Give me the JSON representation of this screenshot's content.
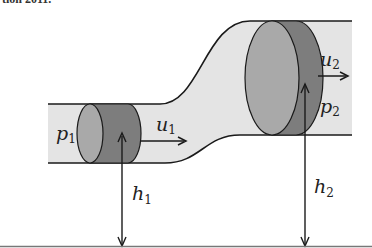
{
  "caption_fragment": "tion 2011.",
  "diagram": {
    "labels": {
      "p1": {
        "base": "p",
        "sub": "1"
      },
      "u1": {
        "base": "u",
        "sub": "1"
      },
      "h1": {
        "base": "h",
        "sub": "1"
      },
      "p2": {
        "base": "p",
        "sub": "2"
      },
      "u2": {
        "base": "u",
        "sub": "2"
      },
      "h2": {
        "base": "h",
        "sub": "2"
      }
    },
    "colors": {
      "pipe_fill": "#e4e4e4",
      "pipe_stroke": "#1a1a1a",
      "cylinder_face": "#a9a9a9",
      "cylinder_body": "#7d7d7d",
      "arrow": "#1a1a1a",
      "ground": "#555555"
    }
  }
}
